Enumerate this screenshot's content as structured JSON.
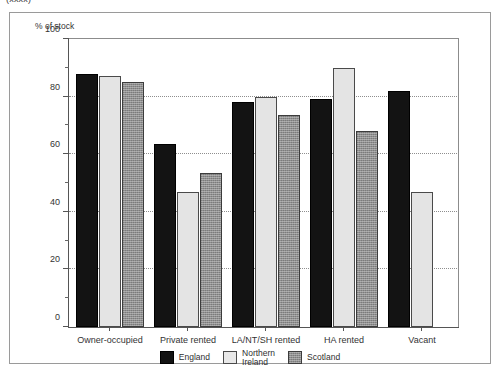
{
  "caption": "(xxxx)",
  "figure": {
    "axis_title": "% of stock",
    "frame_color": "#9a9a9a"
  },
  "legend": {
    "position": "bottom-center",
    "items": [
      {
        "name": "England",
        "color": "#131313"
      },
      {
        "name": "Northern\nIreland",
        "color": "#e8e8e8"
      },
      {
        "name": "Scotland",
        "color": "#8f8f8f"
      }
    ]
  },
  "chart_data": {
    "type": "bar",
    "title": "",
    "subtitle": "",
    "xlabel": "",
    "ylabel": "% of stock",
    "ylim": [
      0,
      100
    ],
    "ytick_labels": [
      "0",
      "20",
      "40",
      "60",
      "80",
      "100"
    ],
    "ytick_values": [
      0,
      20,
      40,
      60,
      80,
      100
    ],
    "yminor_values": [
      10,
      30,
      50,
      70,
      90
    ],
    "gridlines": [
      20,
      40,
      60,
      80
    ],
    "grid": true,
    "categories": [
      "Owner-occupied",
      "Private rented",
      "LA/NT/SH  rented",
      "HA rented",
      "Vacant"
    ],
    "series": [
      {
        "name": "England",
        "color": "#131313",
        "values": [
          88,
          63.5,
          78,
          79,
          82
        ]
      },
      {
        "name": "Northern Ireland",
        "color": "#e8e8e8",
        "values": [
          87,
          47,
          80,
          90,
          47
        ]
      },
      {
        "name": "Scotland",
        "color": "#8f8f8f",
        "values": [
          85,
          53.5,
          73.5,
          68,
          null
        ]
      }
    ]
  }
}
